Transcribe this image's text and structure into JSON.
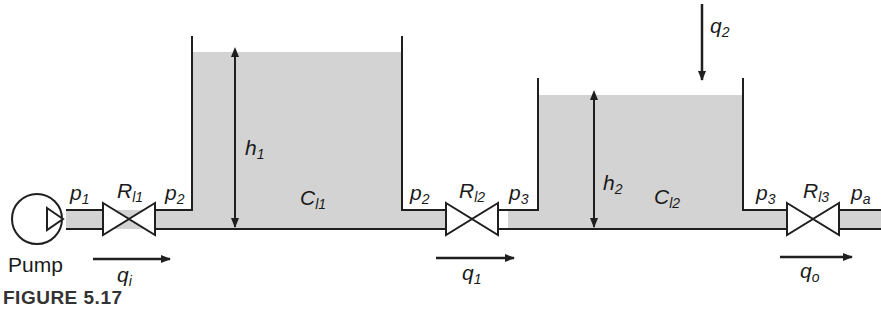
{
  "figure": {
    "caption": "FIGURE 5.17",
    "colors": {
      "liquid": "#d3d3d3",
      "stroke": "#1f1f1f",
      "background": "#ffffff"
    }
  },
  "pump": {
    "label": "Pump"
  },
  "pressures": {
    "p1": {
      "base": "p",
      "sub": "1"
    },
    "p2_left": {
      "base": "p",
      "sub": "2"
    },
    "p2_right": {
      "base": "p",
      "sub": "2"
    },
    "p3_left": {
      "base": "p",
      "sub": "3"
    },
    "p3_right": {
      "base": "p",
      "sub": "3"
    },
    "pa": {
      "base": "p",
      "sub": "a"
    }
  },
  "valves": [
    {
      "base": "R",
      "sub": "l1"
    },
    {
      "base": "R",
      "sub": "l2"
    },
    {
      "base": "R",
      "sub": "l3"
    }
  ],
  "tanks": [
    {
      "capacitance": {
        "base": "C",
        "sub": "l1"
      },
      "height": {
        "base": "h",
        "sub": "1"
      }
    },
    {
      "capacitance": {
        "base": "C",
        "sub": "l2"
      },
      "height": {
        "base": "h",
        "sub": "2"
      }
    }
  ],
  "flows": {
    "qi": {
      "base": "q",
      "sub": "i"
    },
    "q1": {
      "base": "q",
      "sub": "1"
    },
    "q2": {
      "base": "q",
      "sub": "2"
    },
    "qo": {
      "base": "q",
      "sub": "o"
    }
  }
}
